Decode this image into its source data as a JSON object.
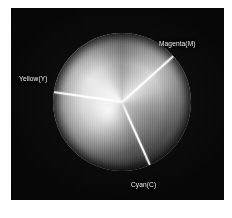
{
  "figure": {
    "kind": "cmy-color-wheel",
    "panel_background": "#060606",
    "page_background": "#ffffff",
    "disc": {
      "center_x": 122,
      "center_y": 102,
      "radius": 69,
      "rendering": "grayscale",
      "description": "Subtractive primary colour disc divided into three sectors by white radial lines"
    },
    "labels": [
      {
        "id": "magenta",
        "text": "Magenta(M)",
        "angle_deg": -42,
        "color": "#f2f2f2"
      },
      {
        "id": "yellow",
        "text": "Yellow(Y)",
        "angle_deg": 188,
        "color": "#f2f2f2"
      },
      {
        "id": "cyan",
        "text": "Cyan(C)",
        "angle_deg": 66,
        "color": "#f2f2f2"
      }
    ],
    "divider_color": "#ffffff"
  },
  "caption": {
    "cutoff_line": "                    "
  }
}
